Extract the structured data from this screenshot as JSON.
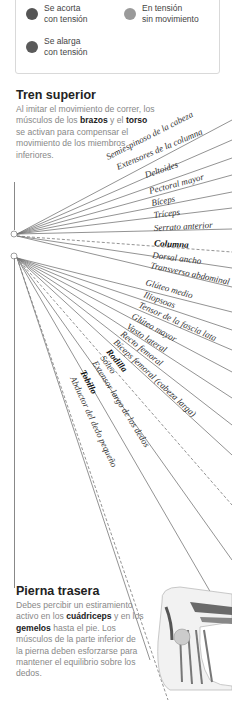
{
  "legend": {
    "items": [
      {
        "label": "Se acorta\ncon tensión",
        "color": "#555555",
        "icon": "dot-dark"
      },
      {
        "label": "En tensión\nsin movimiento",
        "color": "#9a9a9a",
        "icon": "dot-light"
      },
      {
        "label": "Se alarga\ncon tensión",
        "color": "#5a5a5a",
        "icon": "dot-dark"
      }
    ]
  },
  "upper": {
    "title": "Tren superior",
    "body_parts": [
      "Al imitar el movimiento de correr, los músculos de los ",
      "brazos",
      " y el ",
      "torso",
      " se activan para compensar el movimiento de los miembros inferiores."
    ]
  },
  "lower": {
    "title": "Pierna trasera",
    "body_parts": [
      "Debes percibir un estiramiento activo en los ",
      "cuádriceps",
      " y en los ",
      "gemelos",
      " hasta el pie. Los músculos de la parte inferior de la pierna deben esforzarse para mantener el equilibrio sobre los dedos."
    ]
  },
  "labels_upper": [
    {
      "text": "Semiespinoso de la cabeza",
      "bold": false
    },
    {
      "text": "Extensores de la columna",
      "bold": false
    },
    {
      "text": "Deltoides",
      "bold": false
    },
    {
      "text": "Pectoral mayor",
      "bold": false
    },
    {
      "text": "Bíceps",
      "bold": false
    },
    {
      "text": "Tríceps",
      "bold": false
    },
    {
      "text": "Serrato anterior",
      "bold": false
    },
    {
      "text": "Columna",
      "bold": true
    },
    {
      "text": "Dorsal ancho",
      "bold": false
    },
    {
      "text": "Transverso abdominal",
      "bold": false
    }
  ],
  "labels_lower": [
    {
      "text": "Glúteo medio",
      "bold": false
    },
    {
      "text": "Iliopsoas",
      "bold": false
    },
    {
      "text": "Tensor de la fascia lata",
      "bold": false
    },
    {
      "text": "Glúteo mayor",
      "bold": false
    },
    {
      "text": "Vasto lateral",
      "bold": false
    },
    {
      "text": "Recto femoral",
      "bold": false
    },
    {
      "text": "Bíceps femoral (cabeza larga)",
      "bold": false
    },
    {
      "text": "Rodilla",
      "bold": true
    },
    {
      "text": "Sóleo",
      "bold": false
    },
    {
      "text": "Extensor largo de los dedos",
      "bold": false
    },
    {
      "text": "Tobillo",
      "bold": true
    },
    {
      "text": "Abductor del dedo pequeño",
      "bold": false
    }
  ]
}
